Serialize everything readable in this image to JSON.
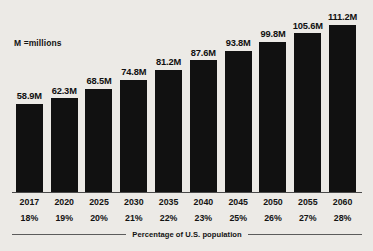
{
  "legend": {
    "note": "M =millions"
  },
  "footer": {
    "caption": "Percentage of U.S. population"
  },
  "colors": {
    "bar": "#111111",
    "background": "#eceae6",
    "axis": "#4a4a4a",
    "text": "#131313"
  },
  "chart_data": {
    "type": "bar",
    "title": "",
    "subtitle": "",
    "xlabel": "",
    "ylabel": "",
    "ylim": [
      0,
      111.2
    ],
    "grid": false,
    "legend_position": "top-left",
    "annotations": [
      "M =millions",
      "Percentage of U.S. population"
    ],
    "categories": [
      "2017",
      "2020",
      "2025",
      "2030",
      "2035",
      "2040",
      "2045",
      "2050",
      "2055",
      "2060"
    ],
    "values": [
      58.9,
      62.3,
      68.5,
      74.8,
      81.2,
      87.6,
      93.8,
      99.8,
      105.6,
      111.2
    ],
    "value_labels": [
      "58.9M",
      "62.3M",
      "68.5M",
      "74.8M",
      "81.2M",
      "87.6M",
      "93.8M",
      "99.8M",
      "105.6M",
      "111.2M"
    ],
    "secondary_labels": [
      "18%",
      "19%",
      "20%",
      "21%",
      "22%",
      "23%",
      "25%",
      "26%",
      "27%",
      "28%"
    ],
    "secondary_label_title": "Percentage of U.S. population",
    "unit": "millions"
  }
}
